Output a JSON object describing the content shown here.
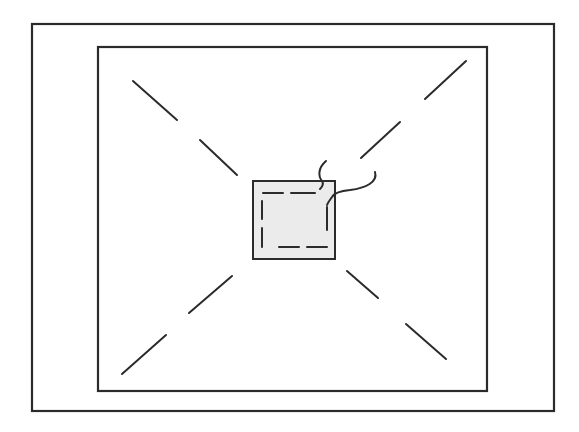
{
  "diagram": {
    "description": "Line drawing: square sheet within a frame, with a small stitched patch at center and diagonal dashed lines radiating to the corners",
    "colors": {
      "stroke": "#2b2b2b",
      "patch_fill": "#ebebeb",
      "background": "#ffffff"
    },
    "outer_frame": {
      "x": 32,
      "y": 24,
      "w": 522,
      "h": 387
    },
    "inner_square": {
      "x": 98,
      "y": 47,
      "w": 389,
      "h": 344
    },
    "center_patch": {
      "x": 253,
      "y": 181,
      "w": 82,
      "h": 78
    },
    "stitching": [
      {
        "x1": 263,
        "y1": 193,
        "x2": 283,
        "y2": 193
      },
      {
        "x1": 291,
        "y1": 193,
        "x2": 315,
        "y2": 193
      },
      {
        "x1": 262,
        "y1": 201,
        "x2": 262,
        "y2": 219
      },
      {
        "x1": 262,
        "y1": 228,
        "x2": 262,
        "y2": 247
      },
      {
        "x1": 327,
        "y1": 207,
        "x2": 327,
        "y2": 230
      },
      {
        "x1": 279,
        "y1": 247,
        "x2": 299,
        "y2": 247
      },
      {
        "x1": 307,
        "y1": 247,
        "x2": 327,
        "y2": 247
      }
    ],
    "diagonal_segments": [
      {
        "name": "top-left-outer",
        "x1": 133,
        "y1": 81,
        "x2": 177,
        "y2": 120
      },
      {
        "name": "top-left-inner",
        "x1": 200,
        "y1": 140,
        "x2": 237,
        "y2": 175
      },
      {
        "name": "top-right-outer",
        "x1": 466,
        "y1": 61,
        "x2": 425,
        "y2": 99
      },
      {
        "name": "top-right-inner",
        "x1": 400,
        "y1": 122,
        "x2": 361,
        "y2": 158
      },
      {
        "name": "bottom-left-inner",
        "x1": 232,
        "y1": 276,
        "x2": 189,
        "y2": 313
      },
      {
        "name": "bottom-left-outer",
        "x1": 166,
        "y1": 335,
        "x2": 122,
        "y2": 374
      },
      {
        "name": "bottom-right-inner",
        "x1": 347,
        "y1": 271,
        "x2": 378,
        "y2": 298
      },
      {
        "name": "bottom-right-outer",
        "x1": 406,
        "y1": 324,
        "x2": 446,
        "y2": 359
      }
    ],
    "threads": [
      {
        "name": "thread-1",
        "d": "M 326 161 C 318 168, 318 176, 322 181 C 324 184, 322 187, 320 189"
      },
      {
        "name": "thread-2",
        "d": "M 375 172 C 378 182, 366 188, 350 190 C 340 191, 334 193, 332 197 C 330 200, 328 202, 327 205"
      }
    ]
  }
}
